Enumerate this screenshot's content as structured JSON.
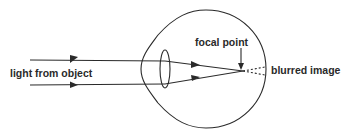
{
  "diagram": {
    "labels": {
      "light": "light from object",
      "focal": "focal point",
      "blurred": "blurred image"
    },
    "colors": {
      "line": "#2a2a2a",
      "background": "#ffffff"
    }
  }
}
